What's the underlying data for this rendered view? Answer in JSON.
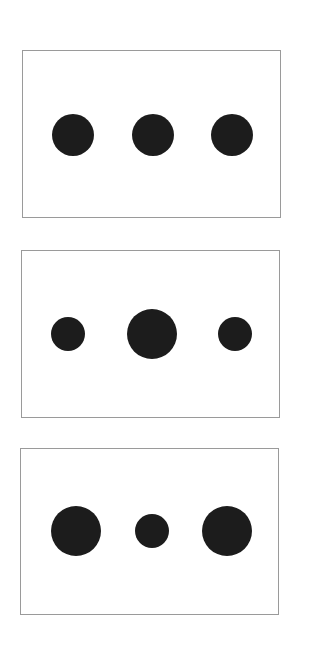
{
  "colors": {
    "dot": "#1c1c1c",
    "border": "#9a9a9a",
    "background": "#ffffff"
  },
  "panels": [
    {
      "name": "panel-1",
      "box": [
        22,
        50,
        259,
        168
      ],
      "dots": [
        {
          "cx": 73,
          "cy": 135,
          "r": 21
        },
        {
          "cx": 153,
          "cy": 135,
          "r": 21
        },
        {
          "cx": 232,
          "cy": 135,
          "r": 21
        }
      ]
    },
    {
      "name": "panel-2",
      "box": [
        21,
        250,
        259,
        168
      ],
      "dots": [
        {
          "cx": 68,
          "cy": 334,
          "r": 17
        },
        {
          "cx": 152,
          "cy": 334,
          "r": 25
        },
        {
          "cx": 235,
          "cy": 334,
          "r": 17
        }
      ]
    },
    {
      "name": "panel-3",
      "box": [
        20,
        448,
        259,
        167
      ],
      "dots": [
        {
          "cx": 76,
          "cy": 531,
          "r": 25
        },
        {
          "cx": 152,
          "cy": 531,
          "r": 17
        },
        {
          "cx": 227,
          "cy": 531,
          "r": 25
        }
      ]
    }
  ]
}
